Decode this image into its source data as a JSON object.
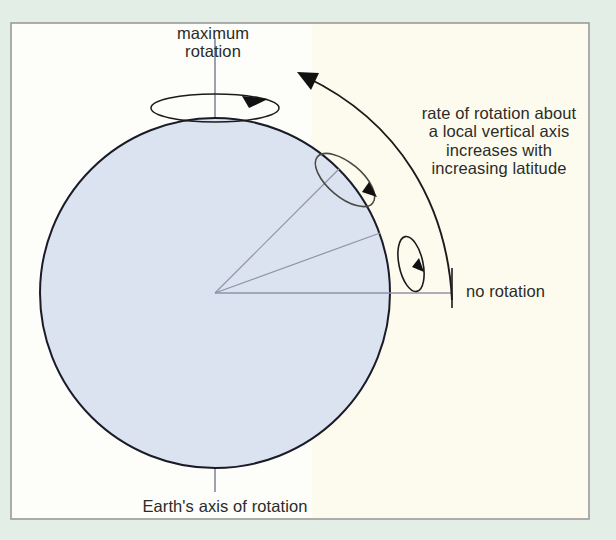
{
  "figure": {
    "background_color": "#e3efe6",
    "panel_color": "#fdfbee",
    "panel_border_color": "#9a9a9a",
    "earth_fill_color": "#dbe3f0",
    "earth_outline_color": "#1b1b28",
    "radius_line_color": "#8f93a8",
    "annotation_color": "#1b1b1b",
    "text_color": "#2b2b28"
  },
  "labels": {
    "maximum_rotation": "maximum\nrotation",
    "rate_of_rotation": "rate of rotation about\na local vertical axis\nincreases with\nincreasing latitude",
    "no_rotation": "no rotation",
    "earth_axis": "Earth's axis of rotation"
  },
  "diagram": {
    "earth": {
      "center_x": 215,
      "center_y": 293,
      "radius": 175
    },
    "axis_line": {
      "x": 215,
      "y_top": 38,
      "y_bottom": 492
    },
    "radii": [
      {
        "name": "pole-radius",
        "angle_deg": 90,
        "latitude": 90
      },
      {
        "name": "mid-latitude-radius",
        "angle_deg": 45,
        "latitude": 45
      },
      {
        "name": "low-latitude-radius",
        "angle_deg": 20,
        "latitude": 20
      },
      {
        "name": "equator-radius",
        "angle_deg": 0,
        "latitude": 0
      }
    ],
    "spin_indicators": [
      {
        "name": "pole-spin",
        "at_latitude": 90,
        "tilt_deg": 0,
        "description": "flat ellipse at north pole, maximum rotation"
      },
      {
        "name": "mid-latitude-spin",
        "at_latitude": 45,
        "tilt_deg": 40,
        "description": "tilted ellipse at mid latitude"
      },
      {
        "name": "equator-spin",
        "at_latitude": 0,
        "tilt_deg": 80,
        "description": "edge-on ellipse at equator, no rotation"
      }
    ],
    "trend_arrow": {
      "name": "increasing-latitude-arrow",
      "from": [
        452,
        300
      ],
      "to": [
        300,
        72
      ],
      "direction": "counterclockwise-upward"
    }
  }
}
